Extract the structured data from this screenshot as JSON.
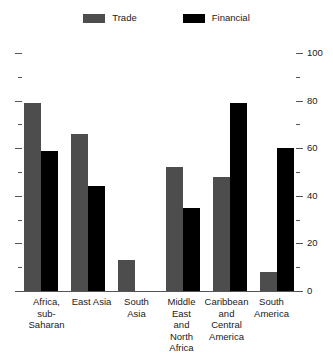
{
  "legend": {
    "position": "top-center",
    "entries": [
      {
        "label": "Trade",
        "color": "#4d4d4d",
        "swatch_name": "trade-swatch"
      },
      {
        "label": "Financial",
        "color": "#000000",
        "swatch_name": "financial-swatch"
      }
    ]
  },
  "axis": {
    "major_ticks": [
      "0",
      "20",
      "40",
      "60",
      "80",
      "100"
    ],
    "minor_ticks": [
      "10",
      "30",
      "50",
      "70",
      "90"
    ],
    "min": 0,
    "max": 100,
    "label_side": "right",
    "left_axis_labeled": false
  },
  "chart_data": {
    "type": "bar",
    "title": "",
    "subtitle": "",
    "xlabel": "",
    "ylabel": "",
    "ylim": [
      0,
      100
    ],
    "grid": false,
    "legend_position": "top-center",
    "categories": [
      "Africa, sub-Saharan",
      "East Asia",
      "South Asia",
      "Middle East and North Africa",
      "Caribbean and Central America",
      "South America"
    ],
    "category_lines": [
      [
        "Africa,",
        "sub-Saharan"
      ],
      [
        "East Asia"
      ],
      [
        "South Asia"
      ],
      [
        "Middle East",
        "and",
        "North Africa"
      ],
      [
        "Caribbean",
        "and Central",
        "America"
      ],
      [
        "South",
        "America"
      ]
    ],
    "series": [
      {
        "name": "Trade",
        "color": "#4d4d4d",
        "values": [
          79,
          66,
          13,
          52,
          48,
          8
        ]
      },
      {
        "name": "Financial",
        "color": "#000000",
        "values": [
          59,
          44,
          0,
          35,
          79,
          60
        ]
      }
    ]
  }
}
